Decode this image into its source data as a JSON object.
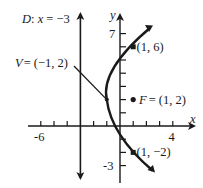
{
  "diagram": {
    "type": "parabola",
    "equation_form": "horizontal parabola opening right",
    "axes": {
      "x_label": "x",
      "y_label": "y",
      "x_range": [
        -6,
        4
      ],
      "y_range": [
        -3,
        7
      ],
      "x_tick_labels": {
        "left": "-6",
        "right": "4"
      },
      "y_tick_labels": {
        "top": "7",
        "bottom": "-3"
      }
    },
    "directrix": {
      "label_prefix": "D",
      "label_eq": "x = −3",
      "x": -3
    },
    "vertex": {
      "label_prefix": "V",
      "label_coord": "= (−1, 2)",
      "point": [
        -1,
        2
      ]
    },
    "focus": {
      "label_prefix": "F",
      "label_coord": "= (1, 2)",
      "point": [
        1,
        2
      ]
    },
    "points": [
      {
        "label": "(1, 6)",
        "point": [
          1,
          6
        ]
      },
      {
        "label": "(1, −2)",
        "point": [
          1,
          -2
        ]
      }
    ],
    "colors": {
      "ink": "#1a1a1a",
      "background": "#ffffff"
    }
  }
}
